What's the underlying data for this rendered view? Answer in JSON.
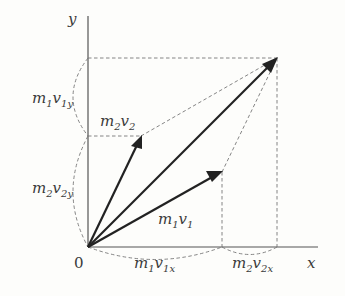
{
  "diagram": {
    "axes": {
      "x_label": "x",
      "y_label": "y",
      "origin_label": "0"
    },
    "vectors": [
      {
        "name": "m1v1",
        "label": "m₁v₁",
        "from": [
          88,
          247
        ],
        "to": [
          222,
          172
        ]
      },
      {
        "name": "m2v2",
        "label": "m₂v₂",
        "from": [
          88,
          247
        ],
        "to": [
          141,
          136
        ]
      },
      {
        "name": "resultant",
        "label": "",
        "from": [
          88,
          247
        ],
        "to": [
          277,
          58
        ]
      }
    ],
    "component_labels": {
      "m1v1x": {
        "base": "m",
        "s1": "1",
        "mid": "v",
        "s2": "1x"
      },
      "m2v2x": {
        "base": "m",
        "s1": "2",
        "mid": "v",
        "s2": "2x"
      },
      "m1v1y": {
        "base": "m",
        "s1": "1",
        "mid": "v",
        "s2": "1y"
      },
      "m2v2y": {
        "base": "m",
        "s1": "2",
        "mid": "v",
        "s2": "2y"
      },
      "m1v1": {
        "base": "m",
        "s1": "1",
        "mid": "v",
        "s2": "1"
      },
      "m2v2": {
        "base": "m",
        "s1": "2",
        "mid": "v",
        "s2": "2"
      }
    },
    "colors": {
      "vector": "#222222",
      "axis": "#555555",
      "dashed": "#777777",
      "text": "#3a3a3a",
      "background": "#fdfdfb"
    }
  }
}
